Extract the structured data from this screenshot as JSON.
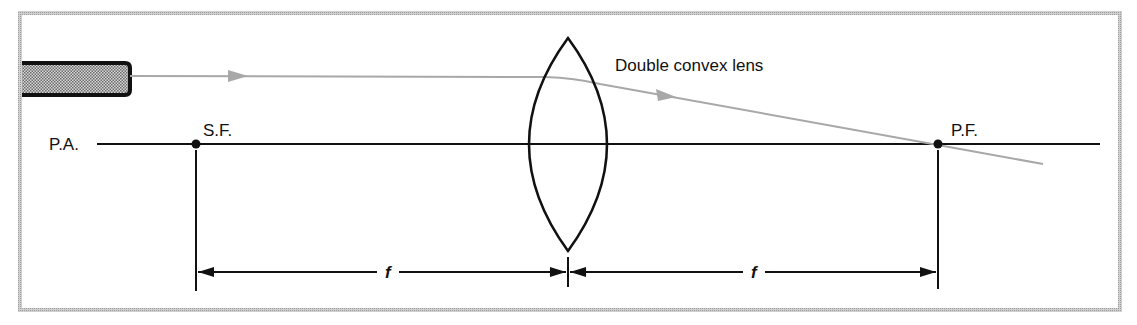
{
  "diagram": {
    "labels": {
      "principal_axis": "P.A.",
      "secondary_focus": "S.F.",
      "principal_focus": "P.F.",
      "lens": "Double convex lens",
      "focal_length_left": "f",
      "focal_length_right": "f"
    },
    "colors": {
      "frame": "#b8b8b8",
      "line": "#111111",
      "ray": "#a8a8a8",
      "flashlight_fill": "#9a9a9a",
      "background": "#ffffff"
    },
    "elements": {
      "light_source": "flashlight",
      "ray_direction": "left-to-right",
      "converges_at": "P.F."
    }
  }
}
